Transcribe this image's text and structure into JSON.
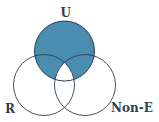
{
  "diagram": {
    "type": "venn",
    "sets": [
      {
        "id": "U",
        "label": "U",
        "cx": 64.5,
        "cy": 51,
        "r": 30
      },
      {
        "id": "R",
        "label": "R",
        "cx": 44,
        "cy": 85,
        "r": 30.5
      },
      {
        "id": "NonE",
        "label": "Non-E",
        "cx": 85,
        "cy": 85,
        "r": 30.5
      }
    ],
    "shaded_region": "U minus (R ∩ Non-E)",
    "colors": {
      "fill": "#4a8db0",
      "stroke": "#2f3e4a",
      "label": "#2f4050"
    }
  }
}
